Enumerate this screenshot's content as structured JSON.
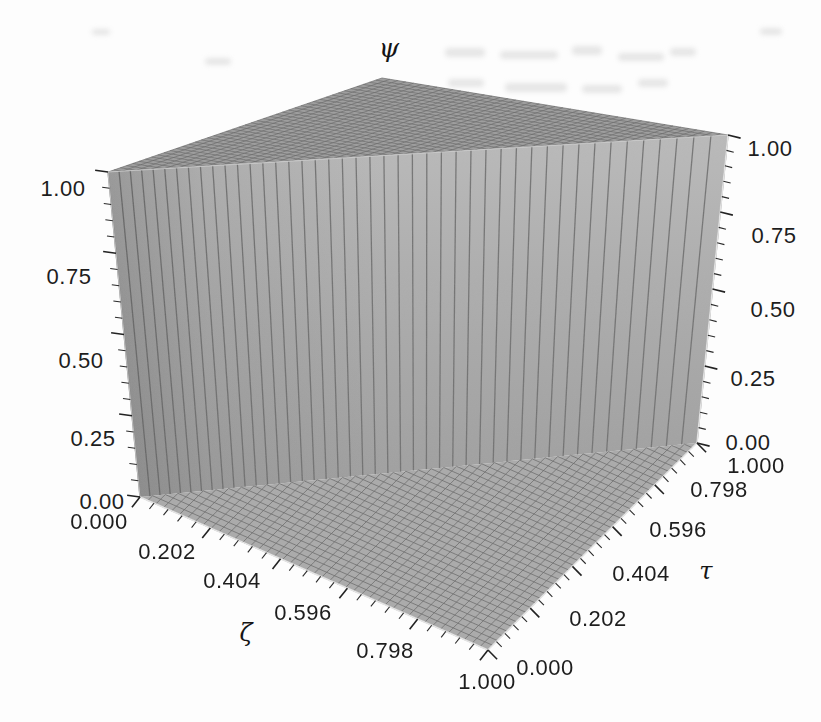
{
  "chart_data": {
    "type": "surface",
    "title": "",
    "axes": {
      "psi": {
        "label": "ψ",
        "range": [
          0,
          1
        ],
        "tick_labels": [
          "0.00",
          "0.25",
          "0.50",
          "0.75",
          "1.00"
        ],
        "shown_on": [
          "left",
          "right"
        ]
      },
      "zeta": {
        "label": "ζ",
        "range": [
          0,
          1
        ],
        "tick_labels": [
          "0.000",
          "0.202",
          "0.404",
          "0.596",
          "0.798",
          "1.000"
        ]
      },
      "tau": {
        "label": "τ",
        "range": [
          0,
          1
        ],
        "tick_labels": [
          "0.000",
          "0.202",
          "0.404",
          "0.596",
          "0.798",
          "1.000"
        ]
      }
    },
    "surface": {
      "description": "Unit step surface: ψ(ζ,τ) = 0 for τ < ζ and ψ(ζ,τ) = 1 for τ ≥ ζ; vertical wall rises along the diagonal τ = ζ.",
      "value_low": 0,
      "value_high": 1,
      "mesh_cells": 44
    },
    "legend": null,
    "grid": "mesh lines on all faces"
  },
  "colors": {
    "wall_top": "#b9b9b9",
    "wall_bottom": "#9e9e9e",
    "top_face": "#9c9c9c",
    "floor_face": "#aaaaaa",
    "mesh_line": "#676767",
    "edge_highlight": "#e8e8e8",
    "text": "#1d1d1d"
  }
}
